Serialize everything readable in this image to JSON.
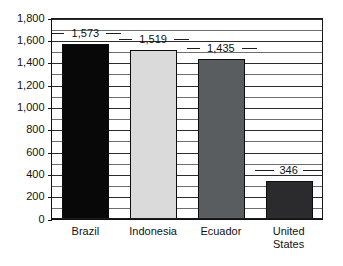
{
  "chart_data": {
    "type": "bar",
    "title": "",
    "subtitle": "",
    "xlabel": "",
    "ylabel": "",
    "categories": [
      "Brazil",
      "Indonesia",
      "Ecuador",
      "United States"
    ],
    "category_lines": [
      [
        "Brazil"
      ],
      [
        "Indonesia"
      ],
      [
        "Ecuador"
      ],
      [
        "United",
        "States"
      ]
    ],
    "values": [
      1573,
      1519,
      1435,
      346
    ],
    "value_labels": [
      "1,573",
      "1,519",
      "1,435",
      "346"
    ],
    "bar_colors": [
      "#080808",
      "#d9dad9",
      "#5a5d5f",
      "#2b2a2c"
    ],
    "ylim": [
      0,
      1800
    ],
    "ytick_values": [
      0,
      200,
      400,
      600,
      800,
      1000,
      1200,
      1400,
      1600,
      1800
    ],
    "ytick_labels": [
      "0",
      "200",
      "400",
      "600",
      "800",
      "1,000",
      "1,200",
      "1,400",
      "1,600",
      "1,800"
    ],
    "minor_tick_step": 100,
    "grid": true,
    "legend": false,
    "legend_position": "none"
  },
  "axes": {
    "y_axis_name": "y-axis",
    "x_axis_name": "x-axis"
  },
  "colors": {
    "background": "#ffffff",
    "frame": "#1a1a1a",
    "gridline_major": "#2c2c2c",
    "gridline_minor": "#6e6e6e",
    "text": "#121212"
  }
}
